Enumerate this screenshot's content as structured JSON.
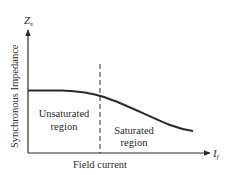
{
  "diagram": {
    "type": "synchronous-impedance-vs-field-current",
    "y_axis": {
      "symbol": "Z",
      "symbol_subscript": "s",
      "label": "Synchronous Impedance"
    },
    "x_axis": {
      "symbol": "I",
      "symbol_subscript": "f",
      "label": "Field current"
    },
    "regions": [
      {
        "line1": "Unsaturated",
        "line2": "region"
      },
      {
        "line1": "Saturated",
        "line2": "region"
      }
    ],
    "curve": {
      "description": "Impedance roughly constant in unsaturated region, decreasing in saturated region"
    },
    "colors": {
      "ink": "#2a2a2a",
      "background": "#ffffff"
    }
  }
}
